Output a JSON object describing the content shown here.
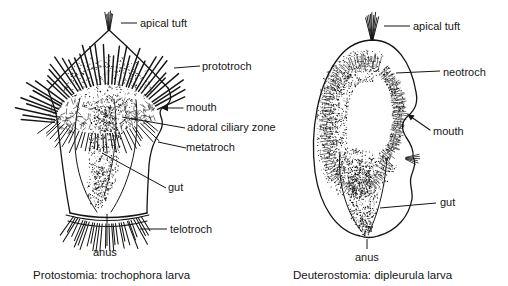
{
  "figure": {
    "left": {
      "caption": "Protostomia: trochophora larva",
      "labels": {
        "apical_tuft": "apical tuft",
        "prototroch": "prototroch",
        "mouth": "mouth",
        "adoral_ciliary_zone": "adoral ciliary zone",
        "metatroch": "metatroch",
        "gut": "gut",
        "telotroch": "telotroch",
        "anus": "anus"
      }
    },
    "right": {
      "caption": "Deuterostomia: dipleurula larva",
      "labels": {
        "apical_tuft": "apical tuft",
        "neotroch": "neotroch",
        "mouth": "mouth",
        "gut": "gut",
        "anus": "anus"
      }
    },
    "colors": {
      "ink": "#151515",
      "background": "#ffffff"
    }
  }
}
